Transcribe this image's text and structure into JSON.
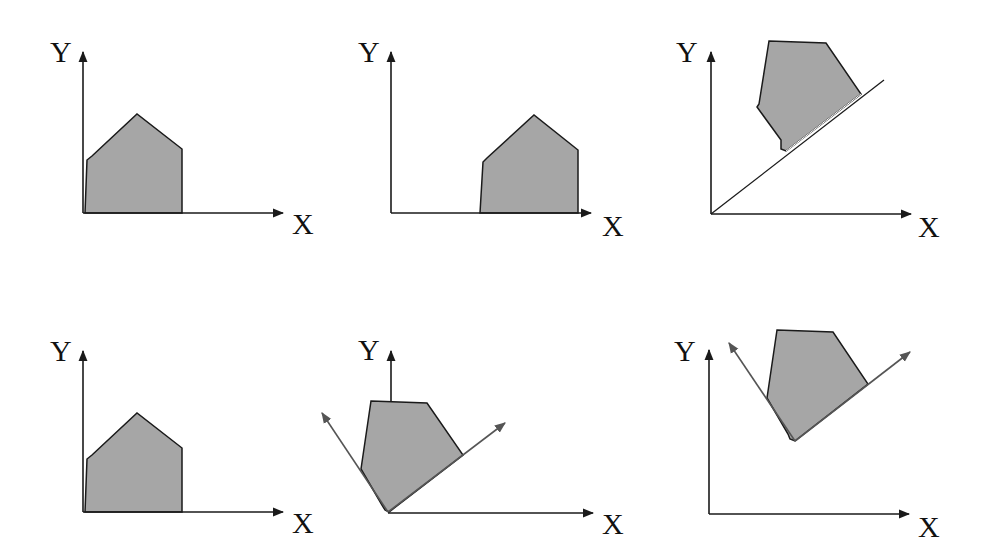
{
  "figure": {
    "colors": {
      "shape_fill": "#a6a6a6",
      "axis": "#1a1a1a",
      "rotated_axis": "#555555",
      "background": "#ffffff"
    },
    "panels": [
      {
        "id": "top-left",
        "x_label": "X",
        "y_label": "Y",
        "content": "original polygon at origin"
      },
      {
        "id": "top-middle",
        "x_label": "X",
        "y_label": "Y",
        "content": "polygon translated along X"
      },
      {
        "id": "top-right",
        "x_label": "X",
        "y_label": "Y",
        "content": "polygon rotated and placed on diagonal line"
      },
      {
        "id": "bottom-left",
        "x_label": "X",
        "y_label": "Y",
        "content": "original polygon at origin"
      },
      {
        "id": "bottom-middle",
        "x_label": "X",
        "y_label": "Y",
        "content": "polygon rotated with rotated local axes at origin"
      },
      {
        "id": "bottom-right",
        "x_label": "X",
        "y_label": "Y",
        "content": "rotated polygon with local axes translated"
      }
    ]
  }
}
